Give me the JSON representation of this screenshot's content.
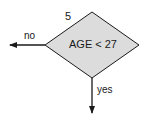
{
  "diagram": {
    "type": "flowchart-decision",
    "node": {
      "id": "5",
      "shape": "diamond",
      "condition": "AGE < 27",
      "fill": "#dcdcdc",
      "stroke": "#1a1a1a"
    },
    "branches": [
      {
        "label": "no",
        "direction": "left"
      },
      {
        "label": "yes",
        "direction": "down"
      }
    ]
  }
}
